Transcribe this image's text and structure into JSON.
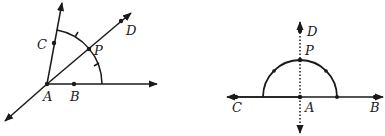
{
  "colors": {
    "stroke": "#1a1a1a",
    "background": "#ffffff"
  },
  "left_figure": {
    "description": "Angle bisector construction: angle CAB bisected by ray AD through P",
    "labels": {
      "A": "A",
      "B": "B",
      "C": "C",
      "D": "D",
      "P": "P"
    },
    "points": {
      "A": [
        47,
        84
      ],
      "B": [
        74,
        84
      ],
      "C": [
        54,
        43
      ],
      "P": [
        89,
        49
      ],
      "D": [
        121,
        21
      ]
    },
    "rays": [
      {
        "name": "ray-AB",
        "from": [
          47,
          84
        ],
        "to": [
          157,
          84
        ]
      },
      {
        "name": "ray-AC",
        "from": [
          47,
          84
        ],
        "to": [
          62,
          3
        ]
      },
      {
        "name": "line-AD",
        "from": [
          5,
          121
        ],
        "to": [
          131,
          13
        ]
      }
    ],
    "arc": {
      "center": [
        47,
        84
      ],
      "radius": 55,
      "from_deg": 0,
      "to_deg": 79
    }
  },
  "right_figure": {
    "description": "Perpendicular at point A on line CB via semicircle; dotted line through P and D",
    "labels": {
      "A": "A",
      "B": "B",
      "C": "C",
      "D": "D",
      "P": "P"
    },
    "points": {
      "A": [
        300,
        97
      ],
      "B": [
        375,
        97
      ],
      "C": [
        236,
        97
      ],
      "P": [
        300,
        60
      ],
      "D": [
        300,
        31
      ]
    },
    "line": {
      "from": [
        227,
        97
      ],
      "to": [
        383,
        97
      ]
    },
    "dotted_perpendicular": {
      "from": [
        300,
        22
      ],
      "to": [
        300,
        133
      ]
    },
    "semicircle": {
      "center": [
        300,
        97
      ],
      "radius": 37
    }
  }
}
